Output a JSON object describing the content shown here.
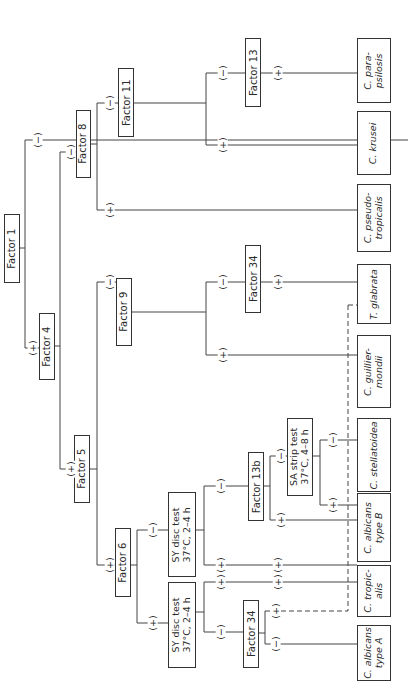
{
  "diagram": {
    "type": "dichotomous identification key (rotated 90°)",
    "nodes": {
      "factor1": "Factor 1",
      "factor4": "Factor 4",
      "factor5": "Factor 5",
      "factor6": "Factor 6",
      "factor8": "Factor 8",
      "factor9": "Factor 9",
      "factor11": "Factor 11",
      "factor13": "Factor 13",
      "factor13b": "Factor 13b",
      "factor34_top": "Factor 34",
      "factor34_low": "Factor 34",
      "sy_disc_upper_l1": "SY disc test",
      "sy_disc_upper_l2": "37°C, 2–4 h",
      "sy_disc_lower_l1": "SY disc test",
      "sy_disc_lower_l2": "37°C, 2–4 h",
      "sa_strip_l1": "SA strip test",
      "sa_strip_l2": "37°C, 4–8 h"
    },
    "leaves": {
      "c_parapsilosis_l1": "C. para-",
      "c_parapsilosis_l2": "psilosis",
      "c_krusei": "C. krusei",
      "c_pseudotropicalis_l1": "C. pseudo-",
      "c_pseudotropicalis_l2": "tropicalis",
      "t_glabrata": "T. glabrata",
      "c_guilliermondii_l1": "C. guillier-",
      "c_guilliermondii_l2": "mondii",
      "c_stellatoidea": "C. stellatoidea",
      "c_albicans_b_l1": "C. albicans",
      "c_albicans_b_l2": "type B",
      "c_tropicalis_l1": "C. tropic-",
      "c_tropicalis_l2": "alis",
      "c_albicans_a_l1": "C. albicans",
      "c_albicans_a_l2": "type A"
    },
    "signs": {
      "plus": "(+)",
      "minus": "(−)"
    }
  }
}
